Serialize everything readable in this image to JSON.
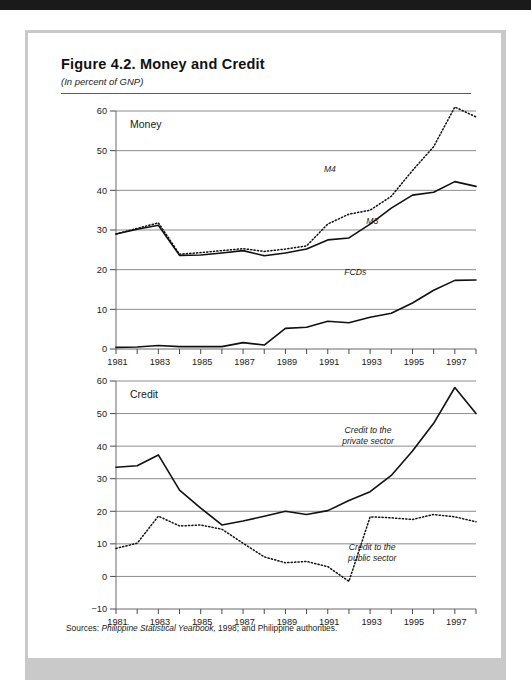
{
  "figure": {
    "title": "Figure 4.2.  Money and Credit",
    "subtitle": "(In percent of GNP)",
    "source_label": "Sources:",
    "source_italic": "Philippine Statistical Yearbook,",
    "source_rest": "1998; and Philippine authorities."
  },
  "chart_data": [
    {
      "type": "line",
      "title": "Money",
      "xlabel": "",
      "ylabel": "",
      "xlim": [
        1981,
        1998
      ],
      "ylim": [
        0,
        60
      ],
      "yticks": [
        0,
        10,
        20,
        30,
        40,
        50,
        60
      ],
      "xticks": [
        1981,
        1983,
        1985,
        1987,
        1989,
        1991,
        1993,
        1995,
        1997
      ],
      "xtick_all": [
        1981,
        1982,
        1983,
        1984,
        1985,
        1986,
        1987,
        1988,
        1989,
        1990,
        1991,
        1992,
        1993,
        1994,
        1995,
        1996,
        1997,
        1998
      ],
      "grid": true,
      "legend": "inline-annotations",
      "x": [
        1981,
        1982,
        1983,
        1984,
        1985,
        1986,
        1987,
        1988,
        1989,
        1990,
        1991,
        1992,
        1993,
        1994,
        1995,
        1996,
        1997,
        1998
      ],
      "series": [
        {
          "name": "M3",
          "style": "solid",
          "label": "M3",
          "label_x": 1993.1,
          "label_y": 31.5,
          "values": [
            29.0,
            30.2,
            31.2,
            23.6,
            23.7,
            24.2,
            24.8,
            23.5,
            24.2,
            25.2,
            27.5,
            28.0,
            31.5,
            35.5,
            38.8,
            39.5,
            42.2,
            41.0
          ]
        },
        {
          "name": "M4",
          "style": "dotted",
          "label": "M4",
          "label_x": 1991.1,
          "label_y": 44.5,
          "values": [
            29.0,
            30.4,
            31.8,
            23.9,
            24.3,
            24.8,
            25.3,
            24.6,
            25.2,
            26.0,
            31.5,
            34.0,
            35.0,
            38.5,
            45.0,
            51.0,
            61.0,
            58.5
          ]
        },
        {
          "name": "FCDs",
          "style": "solid",
          "label": "FCDs",
          "label_x": 1992.3,
          "label_y": 18.6,
          "values": [
            0.4,
            0.5,
            0.9,
            0.6,
            0.6,
            0.6,
            1.6,
            1.0,
            5.2,
            5.5,
            7.0,
            6.6,
            8.0,
            9.0,
            11.6,
            14.8,
            17.3,
            17.4
          ]
        }
      ]
    },
    {
      "type": "line",
      "title": "Credit",
      "xlabel": "",
      "ylabel": "",
      "xlim": [
        1981,
        1998
      ],
      "ylim": [
        -10,
        60
      ],
      "yticks": [
        -10,
        0,
        10,
        20,
        30,
        40,
        50,
        60
      ],
      "xticks": [
        1981,
        1983,
        1985,
        1987,
        1989,
        1991,
        1993,
        1995,
        1997
      ],
      "xtick_all": [
        1981,
        1982,
        1983,
        1984,
        1985,
        1986,
        1987,
        1988,
        1989,
        1990,
        1991,
        1992,
        1993,
        1994,
        1995,
        1996,
        1997,
        1998
      ],
      "grid": true,
      "legend": "inline-annotations",
      "x": [
        1981,
        1982,
        1983,
        1984,
        1985,
        1986,
        1987,
        1988,
        1989,
        1990,
        1991,
        1992,
        1993,
        1994,
        1995,
        1996,
        1997,
        1998
      ],
      "series": [
        {
          "name": "Credit to the private sector",
          "style": "solid",
          "label": "Credit to the\nprivate sector",
          "label_line1": "Credit to the",
          "label_line2": "private sector",
          "label_x": 1992.9,
          "label_y": 44.0,
          "values": [
            33.5,
            34.0,
            37.3,
            26.5,
            21.0,
            15.8,
            17.0,
            18.5,
            20.0,
            19.0,
            20.2,
            23.3,
            26.0,
            31.0,
            38.5,
            47.0,
            58.0,
            50.0
          ]
        },
        {
          "name": "Credit to the public sector",
          "style": "dotted",
          "label": "Credit to the\npublic sector",
          "label_line1": "Credit to the",
          "label_line2": "public sector",
          "label_x": 1993.1,
          "label_y": 8.0,
          "values": [
            8.6,
            10.2,
            18.5,
            15.5,
            15.8,
            14.5,
            10.2,
            6.0,
            4.2,
            4.6,
            3.0,
            -1.5,
            18.3,
            18.0,
            17.5,
            19.0,
            18.3,
            16.8
          ]
        }
      ]
    }
  ]
}
